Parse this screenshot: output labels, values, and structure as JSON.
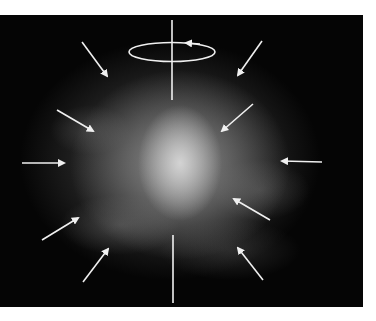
{
  "image": {
    "description": "Grayscale cloudy nebula-like photograph with inward-pointing arrows and a rotation axis symbol",
    "background_color": "#050505",
    "annotation_color": "#f0f0f0",
    "annotations": {
      "rotation_axis": {
        "x": 172,
        "y_top": 20,
        "y_bottom": 100,
        "y_bottom_lower_start": 235,
        "y_bottom_lower_end": 303
      },
      "rotation_ellipse": {
        "cx": 172,
        "cy": 52,
        "rx": 43,
        "ry": 10,
        "direction": "counterclockwise-arrow"
      },
      "arrows_count": 10
    }
  }
}
